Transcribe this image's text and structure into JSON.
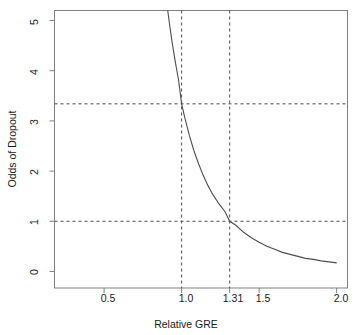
{
  "chart_data": {
    "type": "line",
    "title": "",
    "xlabel": "Relative GRE",
    "ylabel": "Odds of Dropout",
    "xlim": [
      0.18,
      2.07
    ],
    "ylim": [
      -0.33,
      5.2
    ],
    "xticks": [
      0.5,
      1.0,
      1.31,
      1.5,
      2.0
    ],
    "xticklabels": [
      "0.5",
      "1.0",
      "1.31",
      "1.5",
      "2.0"
    ],
    "yticks": [
      0,
      1,
      2,
      3,
      4,
      5
    ],
    "yticklabels": [
      "0",
      "1",
      "2",
      "3",
      "4",
      "5"
    ],
    "grid": false,
    "legend": null,
    "curve": {
      "name": "Odds of Dropout",
      "color": "#4d4d4d",
      "formula": "y = 3.34 * x^-4.47",
      "x": [
        0.85,
        0.88,
        0.9,
        0.92,
        0.94,
        0.96,
        0.98,
        1.0,
        1.02,
        1.05,
        1.08,
        1.11,
        1.14,
        1.17,
        1.2,
        1.24,
        1.28,
        1.31,
        1.35,
        1.4,
        1.45,
        1.5,
        1.55,
        1.6,
        1.65,
        1.7,
        1.75,
        1.8,
        1.85,
        1.9,
        1.95,
        2.0
      ],
      "y": [
        6.99,
        6.0,
        5.45,
        4.97,
        4.54,
        4.16,
        3.82,
        3.34,
        3.07,
        2.71,
        2.4,
        2.14,
        1.91,
        1.71,
        1.54,
        1.35,
        1.19,
        1.0,
        0.92,
        0.78,
        0.67,
        0.58,
        0.5,
        0.44,
        0.38,
        0.34,
        0.3,
        0.26,
        0.24,
        0.21,
        0.19,
        0.17
      ]
    },
    "reference_lines": [
      {
        "name": "vline-1.0",
        "orientation": "vertical",
        "value": 1.0,
        "style": "dashed",
        "color": "#4d4d4d"
      },
      {
        "name": "vline-1.31",
        "orientation": "vertical",
        "value": 1.31,
        "style": "dashed",
        "color": "#4d4d4d"
      },
      {
        "name": "hline-3.34",
        "orientation": "horizontal",
        "value": 3.34,
        "style": "dashed",
        "color": "#4d4d4d"
      },
      {
        "name": "hline-1.0",
        "orientation": "horizontal",
        "value": 1.0,
        "style": "dashed",
        "color": "#4d4d4d"
      }
    ],
    "annotations": []
  },
  "labels": {
    "xtick_0": "0.5",
    "xtick_1": "1.0",
    "xtick_2": "1.31",
    "xtick_3": "1.5",
    "xtick_4": "2.0",
    "ytick_0": "0",
    "ytick_1": "1",
    "ytick_2": "2",
    "ytick_3": "3",
    "ytick_4": "4",
    "ytick_5": "5",
    "xaxis_title": "Relative GRE",
    "yaxis_title": "Odds of Dropout"
  },
  "colors": {
    "curve": "#4d4d4d",
    "axis": "#808080",
    "dash": "#4d4d4d",
    "background": "#ffffff",
    "text": "#1a1a1a"
  }
}
